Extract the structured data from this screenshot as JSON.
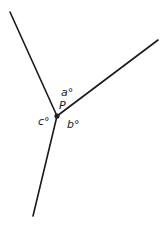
{
  "diagram": {
    "type": "angles-at-a-point",
    "vertex": {
      "label": "P",
      "x": 57,
      "y": 116
    },
    "rays": [
      {
        "name": "upper-left-ray",
        "x1": 57,
        "y1": 116,
        "x2": 10,
        "y2": 12
      },
      {
        "name": "upper-right-ray",
        "x1": 57,
        "y1": 116,
        "x2": 158,
        "y2": 40
      },
      {
        "name": "lower-ray",
        "x1": 57,
        "y1": 116,
        "x2": 33,
        "y2": 216
      }
    ],
    "angle_labels": {
      "a": "a°",
      "b": "b°",
      "c": "c°"
    },
    "colors": {
      "line": "#1a1a1a",
      "background": "#ffffff"
    }
  }
}
